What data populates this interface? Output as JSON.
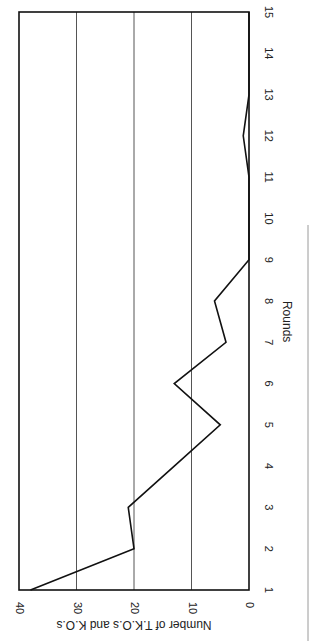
{
  "chart_data": {
    "type": "line",
    "title": "",
    "xlabel": "Rounds",
    "ylabel": "Number of T.K.O.s and K.O.s",
    "categories": [
      1,
      2,
      3,
      4,
      5,
      6,
      7,
      8,
      9,
      10,
      11,
      12,
      13,
      14,
      15
    ],
    "series": [
      {
        "name": "T.K.O.s and K.O.s",
        "values": [
          38,
          20,
          21,
          13,
          5,
          13,
          4,
          6,
          0,
          0,
          0,
          1,
          0,
          0,
          0
        ]
      }
    ],
    "ylim": [
      0,
      40
    ],
    "yticks": [
      0,
      10,
      20,
      30,
      40
    ],
    "xticks": [
      "1",
      "2",
      "3",
      "4",
      "5",
      "6",
      "7",
      "8",
      "9",
      "10",
      "11",
      "12",
      "13",
      "14",
      "15"
    ],
    "grid": "horizontal at 10, 20, 30",
    "legend": "none",
    "orientation": "rotated 90 degrees clockwise on page",
    "colors": {
      "line": "#111111",
      "grid": "#555555",
      "frame": "#111111",
      "side_rule": "#999999"
    }
  }
}
